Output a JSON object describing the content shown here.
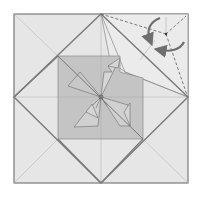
{
  "diagram": {
    "type": "origami-folding-step",
    "description": "Square base with diamond outline, shaded inner square with pinwheel flaps; top-right corner shows a reverse/rotate fold with dashed valley lines and curved arrows",
    "colors": {
      "background": "#ffffff",
      "paper": "#e6e6e6",
      "paper_light": "#ebebeb",
      "inner_square": "#c4c4c4",
      "inner_square_dark": "#b9b9b9",
      "outline": "#7a7a7a",
      "crease": "#b0b0b0",
      "arrow": "#6e6e6e",
      "dashed": "#5a5a5a"
    },
    "elements": [
      {
        "name": "outer-square",
        "kind": "square"
      },
      {
        "name": "diamond",
        "kind": "rotated-square"
      },
      {
        "name": "inner-square",
        "kind": "shaded-square"
      },
      {
        "name": "pinwheel-flaps",
        "kind": "flaps",
        "count": 4
      },
      {
        "name": "corner-fold",
        "kind": "dashed-valley-fold",
        "position": "top-right"
      },
      {
        "name": "rotation-arrows",
        "kind": "curved-arrows",
        "count": 2
      }
    ]
  }
}
